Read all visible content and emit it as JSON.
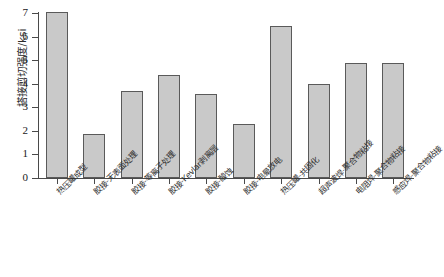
{
  "chart_data": {
    "type": "bar",
    "title": "",
    "xlabel": "",
    "ylabel": "搭接剪切强度/ksi",
    "ylim": [
      0,
      7
    ],
    "yticks": [
      0,
      1,
      2,
      3,
      4,
      5,
      6,
      7
    ],
    "ytick_labels": [
      "0",
      "1",
      "2",
      "3",
      "4",
      "5",
      "6",
      "7"
    ],
    "grid": false,
    "legend": null,
    "bar_color": "#c9c9c9",
    "bar_edge_color": "#5a5a5a",
    "axis_color": "#4a4a4a",
    "categories": [
      "热压罐成型",
      "胶接-无表面处理",
      "胶接-等离子处理",
      "胶接-Kevlar剥离层",
      "胶接-酸蚀",
      "胶接-电晕放电",
      "热压罐-共固化",
      "超声波焊-聚合物粘接",
      "电阻焊-聚合物粘接",
      "感应焊-聚合物粘接"
    ],
    "values": [
      7.05,
      1.85,
      3.7,
      4.35,
      3.55,
      2.3,
      6.45,
      4.0,
      4.9,
      4.9
    ]
  }
}
